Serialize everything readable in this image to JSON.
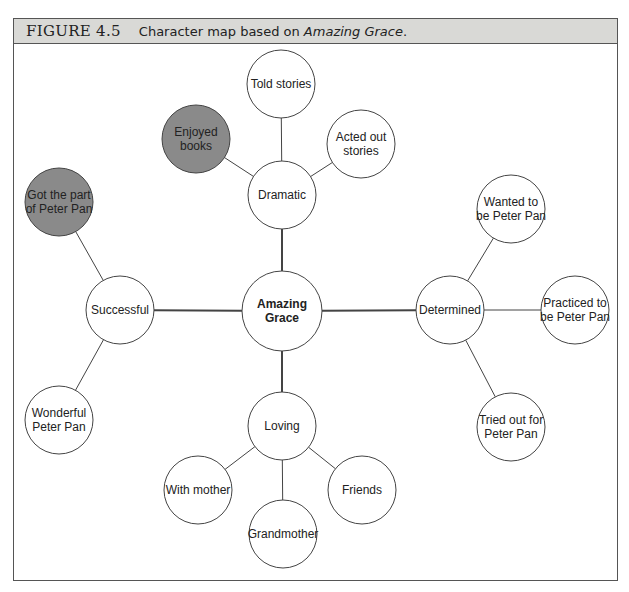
{
  "figure": {
    "number": "FIGURE 4.5",
    "caption_prefix": "Character map based on ",
    "caption_title": "Amazing Grace",
    "caption_suffix": "."
  },
  "colors": {
    "highlight_fill": "#8a8a8a",
    "node_fill": "#ffffff",
    "stroke": "#444444"
  },
  "chart_data": {
    "type": "diagram",
    "title": "Character map based on Amazing Grace.",
    "center": "Amazing Grace",
    "nodes": [
      {
        "id": "center",
        "label": [
          "Amazing",
          "Grace"
        ],
        "x": 282,
        "y": 311,
        "r": 40,
        "bold": true
      },
      {
        "id": "dramatic",
        "label": [
          "Dramatic"
        ],
        "x": 282,
        "y": 195,
        "r": 34
      },
      {
        "id": "told",
        "label": [
          "Told stories"
        ],
        "x": 281,
        "y": 84,
        "r": 34
      },
      {
        "id": "enjoyed",
        "label": [
          "Enjoyed",
          "books"
        ],
        "x": 196,
        "y": 139,
        "r": 34,
        "highlight": true
      },
      {
        "id": "acted",
        "label": [
          "Acted out",
          "stories"
        ],
        "x": 361,
        "y": 144,
        "r": 34
      },
      {
        "id": "successful",
        "label": [
          "Successful"
        ],
        "x": 120,
        "y": 310,
        "r": 34
      },
      {
        "id": "gotpart",
        "label": [
          "Got the part",
          "of Peter Pan"
        ],
        "x": 59,
        "y": 202,
        "r": 34,
        "highlight": true
      },
      {
        "id": "wonderful",
        "label": [
          "Wonderful",
          "Peter Pan"
        ],
        "x": 59,
        "y": 420,
        "r": 34
      },
      {
        "id": "determined",
        "label": [
          "Determined"
        ],
        "x": 450,
        "y": 310,
        "r": 34
      },
      {
        "id": "wanted",
        "label": [
          "Wanted to",
          "be Peter Pan"
        ],
        "x": 511,
        "y": 209,
        "r": 34
      },
      {
        "id": "practiced",
        "label": [
          "Practiced to",
          "be Peter Pan"
        ],
        "x": 575,
        "y": 310,
        "r": 34
      },
      {
        "id": "tried",
        "label": [
          "Tried out for",
          "Peter Pan"
        ],
        "x": 511,
        "y": 427,
        "r": 34
      },
      {
        "id": "loving",
        "label": [
          "Loving"
        ],
        "x": 282,
        "y": 426,
        "r": 34
      },
      {
        "id": "withmother",
        "label": [
          "With mother"
        ],
        "x": 198,
        "y": 490,
        "r": 34
      },
      {
        "id": "grandmother",
        "label": [
          "Grandmother"
        ],
        "x": 283,
        "y": 534,
        "r": 34
      },
      {
        "id": "friends",
        "label": [
          "Friends"
        ],
        "x": 362,
        "y": 490,
        "r": 34
      }
    ],
    "edges": [
      [
        "center",
        "dramatic",
        true
      ],
      [
        "center",
        "successful",
        true
      ],
      [
        "center",
        "determined",
        true
      ],
      [
        "center",
        "loving",
        true
      ],
      [
        "dramatic",
        "told",
        false
      ],
      [
        "dramatic",
        "enjoyed",
        false
      ],
      [
        "dramatic",
        "acted",
        false
      ],
      [
        "successful",
        "gotpart",
        false
      ],
      [
        "successful",
        "wonderful",
        false
      ],
      [
        "determined",
        "wanted",
        false
      ],
      [
        "determined",
        "practiced",
        false
      ],
      [
        "determined",
        "tried",
        false
      ],
      [
        "loving",
        "withmother",
        false
      ],
      [
        "loving",
        "grandmother",
        false
      ],
      [
        "loving",
        "friends",
        false
      ]
    ]
  }
}
